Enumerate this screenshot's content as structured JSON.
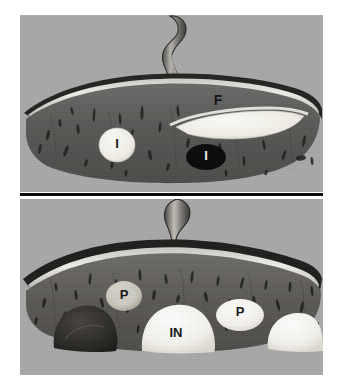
{
  "figure": {
    "background_color": "#ffffff",
    "photo_background_color": "#a9a9a9",
    "divider_color": "#0b0b0b",
    "tissue_color": "#5a5a5a",
    "surface_band_color": "#e8e6e0",
    "lesion_white_color": "#f6f4ee",
    "lesion_black_color": "#090909",
    "lesion_dark_color": "#2e2c2a"
  },
  "panels": [
    {
      "id": "top",
      "name": "upper-specimen-photo",
      "caption": "",
      "stalk": "coiled cord stalk rising from upper surface",
      "labels": [
        {
          "text": "F",
          "target": "white-wedge-lesion",
          "tone": "dark",
          "x": 218,
          "y": 101
        },
        {
          "text": "I",
          "target": "white-round-lesion",
          "tone": "dark",
          "x": 117,
          "y": 145
        },
        {
          "text": "I",
          "target": "black-oval-lesion",
          "tone": "light",
          "x": 206,
          "y": 157
        }
      ]
    },
    {
      "id": "bottom",
      "name": "lower-specimen-photo",
      "caption": "",
      "stalk": "coiled cord stalk rising from upper surface",
      "labels": [
        {
          "text": "P",
          "target": "pale-nodule-left",
          "tone": "dark",
          "x": 124,
          "y": 296
        },
        {
          "text": "IN",
          "target": "large-white-mass",
          "tone": "dark",
          "x": 176,
          "y": 334
        },
        {
          "text": "P",
          "target": "pale-nodule-right",
          "tone": "dark",
          "x": 240,
          "y": 313
        }
      ]
    }
  ]
}
